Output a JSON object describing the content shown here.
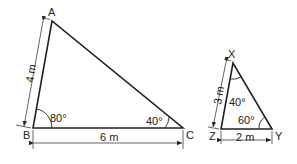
{
  "triangle_abc": {
    "vertices": {
      "A": "A",
      "B": "B",
      "C": "C"
    },
    "side_ab": "4 m",
    "side_bc": "6 m",
    "angle_b": "80°",
    "angle_c": "40°"
  },
  "triangle_xyz": {
    "vertices": {
      "X": "X",
      "Y": "Y",
      "Z": "Z"
    },
    "side_xz": "3 m",
    "side_zy": "2 m",
    "angle_x": "40°",
    "angle_y": "60°"
  },
  "colors": {
    "line": "#222222",
    "background": "#ffffff"
  }
}
